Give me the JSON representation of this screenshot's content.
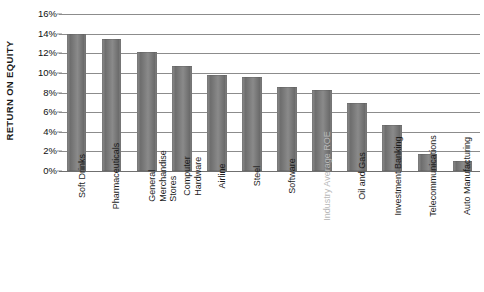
{
  "chart_data": {
    "type": "bar",
    "title": "",
    "xlabel": "",
    "ylabel": "RETURN ON EQUITY",
    "ylim": [
      0,
      16
    ],
    "ytick_labels": [
      "16%",
      "14%",
      "12%",
      "10%",
      "8%",
      "6%",
      "4%",
      "2%",
      "0%"
    ],
    "ytick_values": [
      16,
      14,
      12,
      10,
      8,
      6,
      4,
      2,
      0
    ],
    "grid": true,
    "legend": "none",
    "categories": [
      "Soft Drinks",
      "Pharmaceuticals",
      "General Merchandise Stores",
      "Computer Hardware",
      "Airline",
      "Steel",
      "Software",
      "Industry Average ROE",
      "Oil and Gas",
      "Investment Banking",
      "Telecommunications",
      "Auto Manufacturing"
    ],
    "values": [
      14.0,
      13.5,
      12.1,
      10.7,
      9.8,
      9.6,
      8.6,
      8.3,
      6.9,
      4.7,
      1.7,
      1.0
    ],
    "highlight_category": "Industry Average ROE",
    "bar_color": "#7b7b7b",
    "grid_color": "#8c8c8c",
    "highlight_label_color": "#b9b9b9"
  },
  "axis": {
    "y_title": "RETURN ON EQUITY"
  },
  "category_label_lines": [
    [
      "Soft Drinks"
    ],
    [
      "Pharmaceuticals"
    ],
    [
      "General",
      "Merchandise",
      "Stores"
    ],
    [
      "Computer",
      "Hardware"
    ],
    [
      "Airline"
    ],
    [
      "Steel"
    ],
    [
      "Software"
    ],
    [
      "Industry Average ROE"
    ],
    [
      "Oil and Gas"
    ],
    [
      "Investment Banking"
    ],
    [
      "Telecommunications"
    ],
    [
      "Auto Manufacturing"
    ]
  ]
}
